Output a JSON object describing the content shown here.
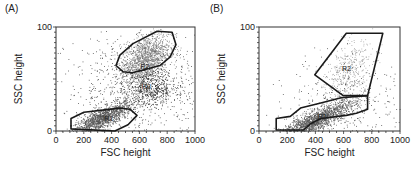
{
  "chart_data": [
    {
      "type": "scatter",
      "panel_label": "(A)",
      "xlabel": "FSC height",
      "ylabel": "SSC height",
      "xlim": [
        0,
        1000
      ],
      "ylim": [
        0,
        100
      ],
      "xticks": [
        0,
        200,
        400,
        600,
        800,
        1000
      ],
      "yticks": [
        0,
        100
      ],
      "grid": false,
      "populations": [
        {
          "name": "R1-cluster",
          "cx": 330,
          "cy": 12,
          "sx": 110,
          "sy": 5,
          "n": 1400,
          "shade": "#555555"
        },
        {
          "name": "R2-cluster",
          "cx": 640,
          "cy": 68,
          "sx": 90,
          "sy": 12,
          "n": 1500,
          "shade": "#7a7a7a"
        },
        {
          "name": "R3-cluster",
          "cx": 690,
          "cy": 40,
          "sx": 90,
          "sy": 8,
          "n": 450,
          "shade": "#222222"
        },
        {
          "name": "background",
          "cx": 600,
          "cy": 45,
          "sx": 260,
          "sy": 25,
          "n": 700,
          "shade": "#333333"
        }
      ],
      "gates": [
        {
          "label": "R1",
          "label_pos": [
            380,
            10
          ],
          "points": [
            [
              108,
              2
            ],
            [
              108,
              12
            ],
            [
              201,
              18
            ],
            [
              460,
              22
            ],
            [
              532,
              21
            ],
            [
              583,
              15
            ],
            [
              518,
              6
            ],
            [
              424,
              0
            ]
          ]
        },
        {
          "label": "R2",
          "label_pos": [
            640,
            60
          ],
          "points": [
            [
              727,
              96
            ],
            [
              835,
              95
            ],
            [
              863,
              83
            ],
            [
              820,
              71
            ],
            [
              748,
              63
            ],
            [
              640,
              59
            ],
            [
              547,
              56
            ],
            [
              482,
              57
            ],
            [
              432,
              63
            ],
            [
              460,
              73
            ],
            [
              554,
              84
            ]
          ]
        },
        {
          "label": "R3",
          "label_pos": [
            650,
            40
          ],
          "points": []
        }
      ]
    },
    {
      "type": "scatter",
      "panel_label": "(B)",
      "xlabel": "FSC height",
      "ylabel": "SSC height",
      "xlim": [
        0,
        1000
      ],
      "ylim": [
        0,
        100
      ],
      "xticks": [
        0,
        200,
        400,
        600,
        800,
        1000
      ],
      "yticks": [
        0,
        100
      ],
      "grid": false,
      "populations": [
        {
          "name": "R1-cluster",
          "cx": 400,
          "cy": 10,
          "sx": 140,
          "sy": 5,
          "n": 1700,
          "shade": "#555555"
        },
        {
          "name": "R2-cluster",
          "cx": 620,
          "cy": 55,
          "sx": 90,
          "sy": 15,
          "n": 450,
          "shade": "#9a9a9a"
        },
        {
          "name": "background",
          "cx": 650,
          "cy": 30,
          "sx": 220,
          "sy": 22,
          "n": 320,
          "shade": "#333333"
        }
      ],
      "gates": [
        {
          "label": "R1",
          "label_pos": [
            450,
            12
          ],
          "points": [
            [
              122,
              1
            ],
            [
              122,
              12
            ],
            [
              222,
              14
            ],
            [
              294,
              22
            ],
            [
              438,
              27
            ],
            [
              582,
              32
            ],
            [
              770,
              34
            ],
            [
              770,
              21
            ],
            [
              691,
              17
            ],
            [
              619,
              15
            ],
            [
              438,
              12
            ],
            [
              366,
              7
            ],
            [
              316,
              1
            ]
          ]
        },
        {
          "label": "R2",
          "label_pos": [
            620,
            58
          ],
          "points": [
            [
              619,
              94
            ],
            [
              878,
              94
            ],
            [
              770,
              34
            ],
            [
              597,
              34
            ],
            [
              396,
              54
            ]
          ]
        }
      ]
    }
  ]
}
